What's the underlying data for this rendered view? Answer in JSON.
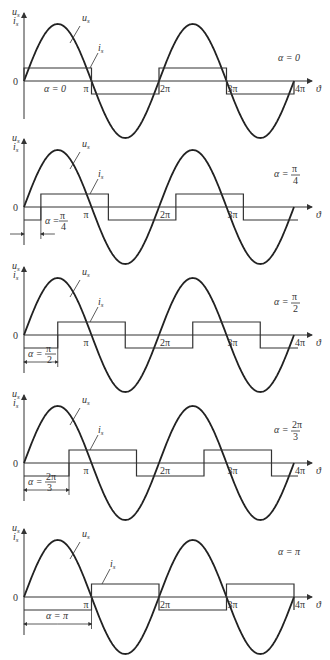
{
  "figure": {
    "x_axis_label": "ϑ",
    "y_axis_label_top": "u",
    "y_axis_label_top_sub": "s",
    "y_axis_label_bottom": "i",
    "y_axis_label_bottom_sub": "s",
    "origin_label": "0",
    "voltage_curve_label": "u",
    "voltage_curve_label_sub": "s",
    "current_curve_label": "i",
    "current_curve_label_sub": "s",
    "tick_labels": [
      "π",
      "2π",
      "3π",
      "4π"
    ]
  },
  "chart_data": [
    {
      "type": "line",
      "title": "α = 0",
      "alpha_rad": 0,
      "alpha_label": "α = 0",
      "alpha_num": "",
      "alpha_den": "",
      "series": [
        {
          "name": "u_s",
          "shape": "sine",
          "amplitude": 1
        },
        {
          "name": "i_s",
          "shape": "square",
          "amplitude": 0.23,
          "phase_shift": "α"
        }
      ],
      "x_ticks": [
        "0",
        "π",
        "2π",
        "3π",
        "4π"
      ],
      "xrange": [
        0,
        "4π"
      ],
      "show_4pi": true
    },
    {
      "type": "line",
      "title": "α = π/4",
      "alpha_rad": 0.7854,
      "alpha_label": "α =",
      "alpha_num": "π",
      "alpha_den": "4",
      "series": [
        {
          "name": "u_s",
          "shape": "sine",
          "amplitude": 1
        },
        {
          "name": "i_s",
          "shape": "square",
          "amplitude": 0.23,
          "phase_shift": "α"
        }
      ],
      "x_ticks": [
        "0",
        "π",
        "2π",
        "3π"
      ],
      "xrange": [
        0,
        "4π"
      ],
      "show_4pi": false
    },
    {
      "type": "line",
      "title": "α = π/2",
      "alpha_rad": 1.5708,
      "alpha_label": "α =",
      "alpha_num": "π",
      "alpha_den": "2",
      "series": [
        {
          "name": "u_s",
          "shape": "sine",
          "amplitude": 1
        },
        {
          "name": "i_s",
          "shape": "square",
          "amplitude": 0.23,
          "phase_shift": "α"
        }
      ],
      "x_ticks": [
        "0",
        "π",
        "2π",
        "3π",
        "4π"
      ],
      "xrange": [
        0,
        "4π"
      ],
      "show_4pi": true
    },
    {
      "type": "line",
      "title": "α = 2π/3",
      "alpha_rad": 2.0944,
      "alpha_label": "α =",
      "alpha_num": "2π",
      "alpha_den": "3",
      "series": [
        {
          "name": "u_s",
          "shape": "sine",
          "amplitude": 1
        },
        {
          "name": "i_s",
          "shape": "square",
          "amplitude": 0.23,
          "phase_shift": "α"
        }
      ],
      "x_ticks": [
        "0",
        "π",
        "2π",
        "3π",
        "4π"
      ],
      "xrange": [
        0,
        "4π"
      ],
      "show_4pi": true
    },
    {
      "type": "line",
      "title": "α = π",
      "alpha_rad": 3.1416,
      "alpha_label": "α = π",
      "alpha_num": "",
      "alpha_den": "",
      "series": [
        {
          "name": "u_s",
          "shape": "sine",
          "amplitude": 1
        },
        {
          "name": "i_s",
          "shape": "square",
          "amplitude": 0.23,
          "phase_shift": "α"
        }
      ],
      "x_ticks": [
        "0",
        "π",
        "2π",
        "3π",
        "4π"
      ],
      "xrange": [
        0,
        "4π"
      ],
      "show_4pi": true
    }
  ],
  "layout": {
    "x0": 24,
    "px_per_pi": 67.5,
    "amp": 57,
    "sq_amp": 13,
    "baselines": [
      81,
      207,
      335,
      463,
      597
    ],
    "colors": {
      "line": "#222222",
      "axis": "#333333",
      "background": "#ffffff"
    }
  }
}
